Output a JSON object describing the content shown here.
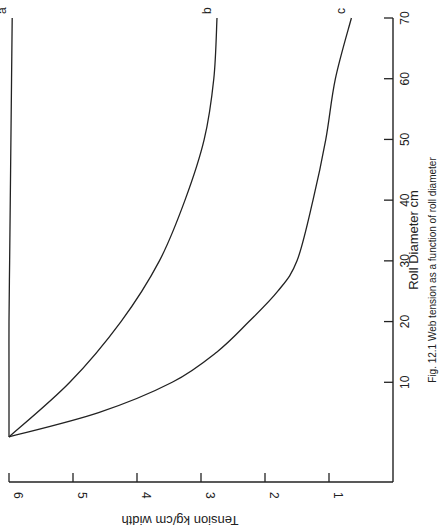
{
  "chart_data": {
    "type": "line",
    "orientation": "rotated-90-clockwise",
    "title": "",
    "caption": "Fig. 12.1 Web tension as a function of roll diameter",
    "xlabel": "Roll Diameter  cm",
    "ylabel": "Tension   kg/cm width",
    "xlim": [
      0,
      70
    ],
    "ylim": [
      0,
      6
    ],
    "xticks": [
      10,
      20,
      30,
      40,
      50,
      60,
      70
    ],
    "yticks": [
      1,
      2,
      3,
      4,
      5,
      6
    ],
    "grid": false,
    "legend": "inline curve labels",
    "series": [
      {
        "name": "a",
        "x": [
          1,
          10,
          20,
          30,
          40,
          50,
          60,
          70
        ],
        "values": [
          6.0,
          6.0,
          6.0,
          5.99,
          5.98,
          5.97,
          5.96,
          5.95
        ]
      },
      {
        "name": "b",
        "x": [
          1,
          10,
          20,
          30,
          40,
          50,
          60,
          70
        ],
        "values": [
          6.0,
          5.05,
          4.25,
          3.65,
          3.25,
          2.95,
          2.8,
          2.75
        ]
      },
      {
        "name": "c",
        "x": [
          1,
          5,
          10,
          15,
          20,
          25,
          30,
          40,
          50,
          60,
          70
        ],
        "values": [
          6.0,
          4.6,
          3.45,
          2.75,
          2.25,
          1.8,
          1.5,
          1.25,
          1.05,
          0.9,
          0.65
        ]
      }
    ]
  },
  "labels": {
    "x_ticks": [
      "10",
      "20",
      "30",
      "40",
      "50",
      "60",
      "70"
    ],
    "y_ticks": [
      "1",
      "2",
      "3",
      "4",
      "5",
      "6"
    ],
    "x_axis_title": "Roll Diameter  cm",
    "y_axis_title": "Tension   kg/cm width",
    "curve_a": "a",
    "curve_b": "b",
    "curve_c": "c",
    "caption": "Fig. 12.1 Web tension as a function of roll diameter"
  },
  "colors": {
    "ink": "#222222",
    "background": "#ffffff"
  }
}
